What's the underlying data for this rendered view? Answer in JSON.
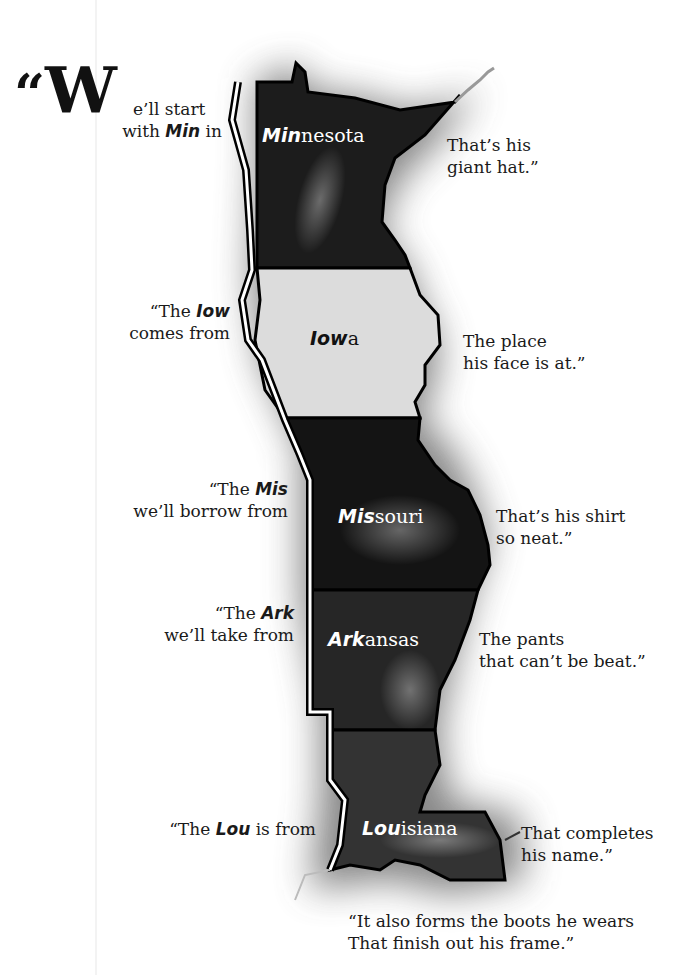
{
  "intro": {
    "open_quote": "“",
    "drop_cap": "W",
    "line1_rest": "e’ll start",
    "line2_pre": "with ",
    "line2_bold": "Min",
    "line2_post": " in"
  },
  "states": [
    {
      "name": "Minnesota",
      "bold": "Min",
      "rest": "nesota",
      "fill": "#1c1c1c"
    },
    {
      "name": "Iowa",
      "bold": "Iow",
      "rest": "a",
      "fill": "#dcdcdc"
    },
    {
      "name": "Missouri",
      "bold": "Mis",
      "rest": "souri",
      "fill": "#141414"
    },
    {
      "name": "Arkansas",
      "bold": "Ark",
      "rest": "ansas",
      "fill": "#262626"
    },
    {
      "name": "Louisiana",
      "bold": "Lou",
      "rest": "isiana",
      "fill": "#333333"
    }
  ],
  "left_text": [
    {
      "pre": "",
      "bold": "",
      "post": "",
      "line2": ""
    },
    {
      "pre": "“The ",
      "bold": "Iow",
      "post": "",
      "line2": "comes from"
    },
    {
      "pre": "“The ",
      "bold": "Mis",
      "post": "",
      "line2": "we’ll borrow from"
    },
    {
      "pre": "“The ",
      "bold": "Ark",
      "post": "",
      "line2": "we’ll take from"
    },
    {
      "pre": "“The ",
      "bold": "Lou",
      "post": " is from",
      "line2": ""
    }
  ],
  "right_text": [
    {
      "line1": "That’s his",
      "line2": "giant hat.”"
    },
    {
      "line1": "The place",
      "line2": "his face is at.”"
    },
    {
      "line1": "That’s his shirt",
      "line2": "so neat.”"
    },
    {
      "line1": "The pants",
      "line2": "that can’t be beat.”"
    },
    {
      "line1": "That completes",
      "line2": "his name.”"
    }
  ],
  "closing": {
    "line1": "“It also forms the boots he wears",
    "line2": "That finish out his frame.”"
  }
}
